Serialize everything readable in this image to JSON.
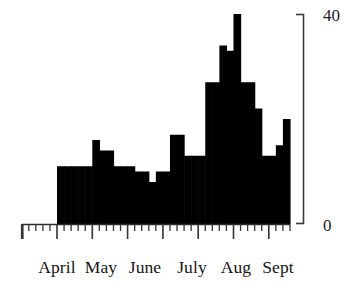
{
  "chart_data": {
    "type": "bar",
    "title": "",
    "subtitle": "",
    "xlabel": "",
    "ylabel": "",
    "ylim": [
      0,
      40
    ],
    "grid": false,
    "legend": null,
    "y_ticks": [
      "0",
      "40"
    ],
    "y_tick_values": [
      0,
      40
    ],
    "x_tick_labels": [
      "April",
      "May",
      "June",
      "July",
      "Aug",
      "Sept"
    ],
    "bar_fill_color": "#000000",
    "axis_color": "#333333",
    "background_color": "#ffffff",
    "minor_ticks_per_month": 5,
    "bin_width_days": 6,
    "categories": [
      "b1",
      "b2",
      "b3",
      "b4",
      "b5",
      "b6",
      "b7",
      "b8",
      "b9",
      "b10",
      "b11",
      "b12",
      "b13",
      "b14",
      "b15",
      "b16",
      "b17",
      "b18",
      "b19",
      "b20",
      "b21",
      "b22",
      "b23",
      "b24",
      "b25",
      "b26",
      "b27",
      "b28",
      "b29",
      "b30",
      "b31",
      "b32",
      "b33"
    ],
    "values": [
      11,
      11,
      11,
      11,
      11,
      16,
      14,
      14,
      11,
      11,
      11,
      10,
      10,
      8,
      10,
      10,
      17,
      17,
      13,
      13,
      13,
      27,
      27,
      34,
      33,
      40,
      27,
      27,
      22,
      13,
      13,
      15,
      20
    ]
  },
  "yaxis": {
    "top_label": "40",
    "bottom_label": "0"
  },
  "xaxis": {
    "labels": [
      "April",
      "May",
      "June",
      "July",
      "Aug",
      "Sept"
    ]
  }
}
